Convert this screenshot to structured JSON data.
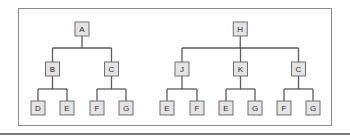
{
  "diagram": {
    "type": "tree-comparison",
    "trees": [
      {
        "id": "tree-1",
        "root": {
          "label": "A",
          "children": [
            {
              "label": "B",
              "children": [
                {
                  "label": "D"
                },
                {
                  "label": "E"
                }
              ]
            },
            {
              "label": "C",
              "children": [
                {
                  "label": "F"
                },
                {
                  "label": "G"
                }
              ]
            }
          ]
        }
      },
      {
        "id": "tree-2",
        "root": {
          "label": "H",
          "children": [
            {
              "label": "J",
              "children": [
                {
                  "label": "E"
                },
                {
                  "label": "F"
                }
              ]
            },
            {
              "label": "K",
              "children": [
                {
                  "label": "E"
                },
                {
                  "label": "G"
                }
              ]
            },
            {
              "label": "C",
              "children": [
                {
                  "label": "F"
                },
                {
                  "label": "G"
                }
              ]
            }
          ]
        }
      }
    ],
    "colors": {
      "node_fill": "#e4e4e4",
      "node_stroke": "#6e6e6e",
      "edge": "#5a5a5a",
      "frame": "#8a8a8a"
    }
  }
}
